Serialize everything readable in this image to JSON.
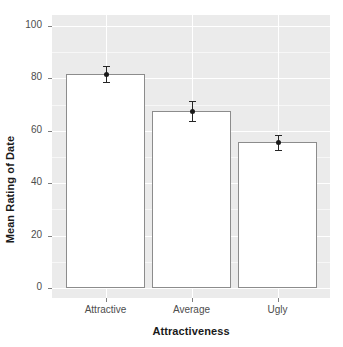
{
  "chart_data": {
    "type": "bar",
    "title": "",
    "subtitle": "",
    "xlabel": "Attractiveness",
    "ylabel": "Mean Rating of Date",
    "categories": [
      "Attractive",
      "Average",
      "Ugly"
    ],
    "values": [
      81.7,
      67.6,
      55.7
    ],
    "errors_low": [
      78.5,
      63.8,
      52.8
    ],
    "errors_high": [
      84.8,
      71.2,
      58.5
    ],
    "ylim": [
      0,
      105
    ],
    "y_ticks": [
      0,
      20,
      40,
      60,
      80,
      100
    ],
    "y_tick_labels": [
      "0",
      "20",
      "40",
      "60",
      "80",
      "100"
    ],
    "grid": true,
    "legend": "none",
    "bar_fill": "#ffffff",
    "bar_border": "#8c8c8c",
    "panel_background": "#ebebeb",
    "gridline_color": "#ffffff",
    "error_bar_color": "#262626",
    "point_marker": "filled-circle"
  },
  "axis": {
    "y_title": "Mean Rating of Date",
    "x_title": "Attractiveness"
  },
  "ticks": {
    "y": [
      {
        "label": "100",
        "value": 100
      },
      {
        "label": "80",
        "value": 80
      },
      {
        "label": "60",
        "value": 60
      },
      {
        "label": "40",
        "value": 40
      },
      {
        "label": "20",
        "value": 20
      },
      {
        "label": "0",
        "value": 0
      }
    ],
    "x": [
      {
        "label": "Attractive"
      },
      {
        "label": "Average"
      },
      {
        "label": "Ugly"
      }
    ]
  }
}
